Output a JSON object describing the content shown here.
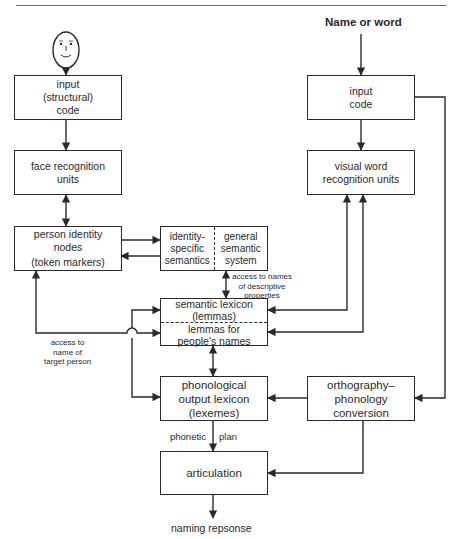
{
  "diagram": {
    "type": "cognitive-model-flowchart",
    "inputs": {
      "face": "face-icon",
      "word": "Name or word"
    },
    "boxes": {
      "face_input": [
        "input",
        "(structural)",
        "code"
      ],
      "face_recognition": [
        "face recognition",
        "units"
      ],
      "person_identity": [
        "person identity",
        "nodes",
        "(token markers)"
      ],
      "semantics_left": [
        "identity-",
        "specific",
        "semantics"
      ],
      "semantics_right": [
        "general",
        "semantic",
        "system"
      ],
      "word_input": [
        "input",
        "code"
      ],
      "visual_word": [
        "visual word",
        "recognition units"
      ],
      "lexicon_top": [
        "semantic lexicon",
        "(lemmas)"
      ],
      "lexicon_bottom": [
        "lemmas for",
        "people's names"
      ],
      "phonological": [
        "phonological",
        "output lexicon",
        "(lexemes)"
      ],
      "orthography": [
        "orthography–",
        "phonology",
        "conversion"
      ],
      "articulation": [
        "articulation"
      ]
    },
    "labels": {
      "descriptive": [
        "access to names",
        "of descriptive",
        "properties"
      ],
      "target_person": [
        "access to",
        "name of",
        "target person"
      ],
      "phonetic": "phonetic",
      "plan": "plan"
    },
    "output": "naming repsonse",
    "colors": {
      "stroke": "#2a2a2a",
      "background": "#ffffff",
      "rule": "#6a6a6a"
    }
  }
}
